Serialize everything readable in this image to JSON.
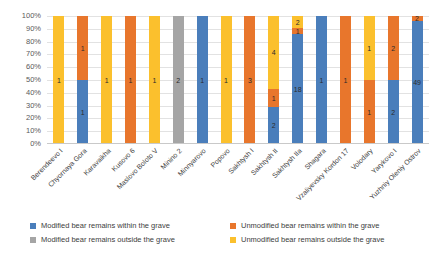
{
  "chart_data": {
    "type": "bar",
    "subtype": "100-percent-stacked-column",
    "title": "",
    "xlabel": "",
    "ylabel": "",
    "ylim": [
      0,
      100
    ],
    "grid": true,
    "legend_position": "bottom",
    "ytick_labels": [
      "100%",
      "90%",
      "80%",
      "70%",
      "60%",
      "50%",
      "40%",
      "30%",
      "20%",
      "10%",
      "0%"
    ],
    "ytick_values": [
      100,
      90,
      80,
      70,
      60,
      50,
      40,
      30,
      20,
      10,
      0
    ],
    "categories": [
      "Berendeevo I",
      "Chyornaya Gora",
      "Karavaikha",
      "Kusovo 6",
      "Maslovo Boloto V",
      "Minino 2",
      "Minnyarovo",
      "Popovo",
      "Sakhtysh I",
      "Sakhtysh II",
      "Sakhtysh IIa",
      "Shagara",
      "Vzaliyevsky Kordon 17",
      "Volodary",
      "Yarykovo I",
      "Yuzhniy Oleniy Ostrov"
    ],
    "series": [
      {
        "name": "Modified bear remains within the grave",
        "color": "#4a7ebb",
        "values": [
          0,
          1,
          0,
          0,
          0,
          0,
          1,
          0,
          0,
          2,
          18,
          1,
          0,
          0,
          2,
          49
        ]
      },
      {
        "name": "Unmodified bear remains within the grave",
        "color": "#e8762c",
        "values": [
          0,
          1,
          0,
          1,
          0,
          0,
          0,
          0,
          3,
          1,
          1,
          0,
          1,
          1,
          2,
          2
        ]
      },
      {
        "name": "Modified bear remains outside the grave",
        "color": "#a5a5a5",
        "values": [
          0,
          0,
          0,
          0,
          0,
          2,
          0,
          0,
          0,
          0,
          0,
          0,
          0,
          0,
          0,
          0
        ]
      },
      {
        "name": "Unmodified bear remains outside the grave",
        "color": "#fbc02d",
        "values": [
          1,
          0,
          1,
          0,
          1,
          0,
          0,
          1,
          0,
          4,
          2,
          0,
          0,
          1,
          0,
          0
        ]
      }
    ]
  },
  "legend": {
    "items": [
      {
        "label": "Modified bear remains within the grave",
        "color": "#4a7ebb"
      },
      {
        "label": "Unmodified bear remains within the grave",
        "color": "#e8762c"
      },
      {
        "label": "Modified bear remains outside the grave",
        "color": "#a5a5a5"
      },
      {
        "label": "Unmodified bear remains outside the grave",
        "color": "#fbc02d"
      }
    ]
  }
}
